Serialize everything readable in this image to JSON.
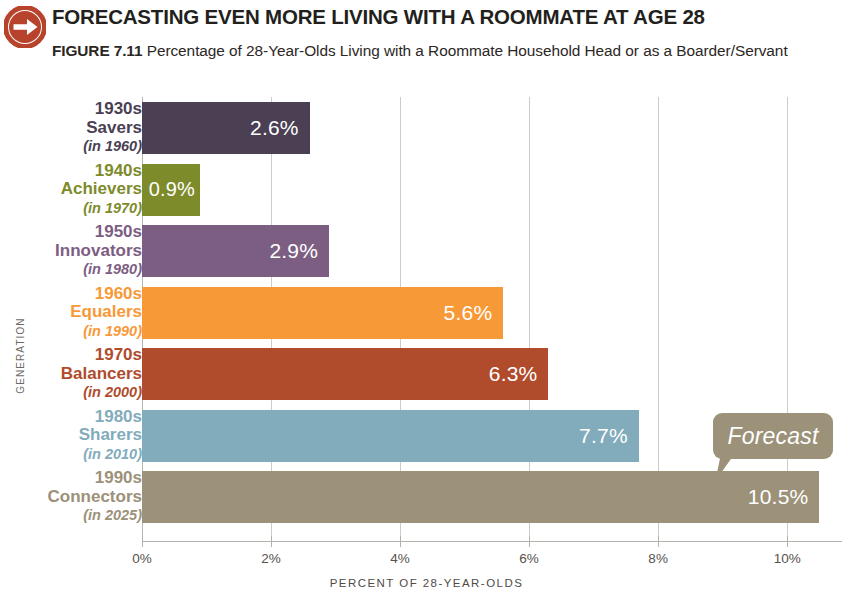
{
  "header": {
    "arrow_icon": "arrow-right-circle-icon",
    "kicker": "FORECASTING EVEN MORE LIVING WITH A ROOMMATE AT AGE 28",
    "figure_number": "FIGURE 7.11",
    "figure_caption": "Percentage of 28-Year-Olds Living with a Roommate Household Head or as a Boarder/Servant"
  },
  "annotation": {
    "forecast_label": "Forecast"
  },
  "colors": {
    "badge": "#b8432c",
    "savers": "#4a3f53",
    "achievers": "#7d8b2b",
    "innovators": "#7d5e83",
    "equalers": "#f89938",
    "balancers": "#b04c2c",
    "sharers": "#82acbb",
    "connectors": "#9c9179"
  },
  "chart_data": {
    "type": "bar",
    "orientation": "horizontal",
    "title": "FORECASTING EVEN MORE LIVING WITH A ROOMMATE AT AGE 28",
    "subtitle": "Percentage of 28-Year-Olds Living with a Roommate Household Head or as a Boarder/Servant",
    "xlabel": "PERCENT OF 28-YEAR-OLDS",
    "ylabel": "GENERATION",
    "xlim": [
      0,
      10.85
    ],
    "xticks": [
      "0%",
      "2%",
      "4%",
      "6%",
      "8%",
      "10%"
    ],
    "xtick_values": [
      0,
      2,
      4,
      6,
      8,
      10
    ],
    "grid": true,
    "legend": false,
    "categories": [
      "1930s Savers (in 1960)",
      "1940s Achievers (in 1970)",
      "1950s Innovators (in 1980)",
      "1960s Equalers (in 1990)",
      "1970s Balancers (in 2000)",
      "1980s Sharers (in 2010)",
      "1990s Connectors (in 2025)"
    ],
    "values": [
      2.6,
      0.9,
      2.9,
      5.6,
      6.3,
      7.7,
      10.5
    ],
    "bars": [
      {
        "generation": "1930s",
        "name": "Savers",
        "year": "(in 1960)",
        "value": 2.6,
        "value_label": "2.6%",
        "color": "#4a3f53"
      },
      {
        "generation": "1940s",
        "name": "Achievers",
        "year": "(in 1970)",
        "value": 0.9,
        "value_label": "0.9%",
        "color": "#7d8b2b"
      },
      {
        "generation": "1950s",
        "name": "Innovators",
        "year": "(in 1980)",
        "value": 2.9,
        "value_label": "2.9%",
        "color": "#7d5e83"
      },
      {
        "generation": "1960s",
        "name": "Equalers",
        "year": "(in 1990)",
        "value": 5.6,
        "value_label": "5.6%",
        "color": "#f89938"
      },
      {
        "generation": "1970s",
        "name": "Balancers",
        "year": "(in 2000)",
        "value": 6.3,
        "value_label": "6.3%",
        "color": "#b04c2c"
      },
      {
        "generation": "1980s",
        "name": "Sharers",
        "year": "(in 2010)",
        "value": 7.7,
        "value_label": "7.7%",
        "color": "#82acbb"
      },
      {
        "generation": "1990s",
        "name": "Connectors",
        "year": "(in 2025)",
        "value": 10.5,
        "value_label": "10.5%",
        "color": "#9c9179"
      }
    ],
    "annotations": [
      {
        "text": "Forecast",
        "target_category": "1990s Connectors (in 2025)"
      }
    ]
  }
}
